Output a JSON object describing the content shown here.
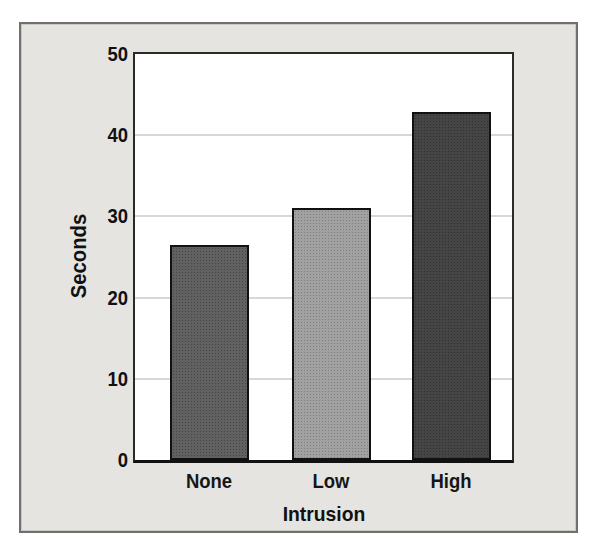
{
  "chart_data": {
    "type": "bar",
    "title": "",
    "xlabel": "Intrusion",
    "ylabel": "Seconds",
    "categories": [
      "None",
      "Low",
      "High"
    ],
    "values": [
      26.5,
      31,
      42.8
    ],
    "ylim": [
      0,
      50
    ],
    "yticks": [
      0,
      10,
      20,
      30,
      40,
      50
    ],
    "grid": "horizontal-every-10",
    "legend": "none",
    "bar_colors": [
      "#585858",
      "#9c9c9c",
      "#3b3b3b"
    ],
    "bar_border_color": "#111111"
  },
  "colors": {
    "page_background": "#ffffff",
    "card_background": "#e5e4e1",
    "card_border": "#707070",
    "plot_background": "#ffffff",
    "plot_border": "#2a2a2a",
    "gridline": "#d9d7d2",
    "text": "#111111"
  }
}
